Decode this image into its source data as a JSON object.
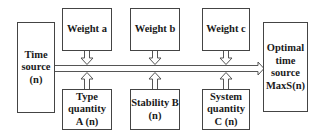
{
  "diagram": {
    "input": {
      "label": "Time\nsource\n(n)"
    },
    "output": {
      "label": "Optimal\ntime\nsource\nMaxS(n)"
    },
    "weights": [
      {
        "label": "Weight a"
      },
      {
        "label": "Weight b"
      },
      {
        "label": "Weight c"
      }
    ],
    "factors": [
      {
        "label": "Type\nquantity\nA (n)"
      },
      {
        "label": "Stability B\n(n)"
      },
      {
        "label": "System\nquantity\nC (n)"
      }
    ],
    "colors": {
      "stroke": "#444444",
      "text": "#1a1a1a",
      "background": "#ffffff"
    }
  }
}
